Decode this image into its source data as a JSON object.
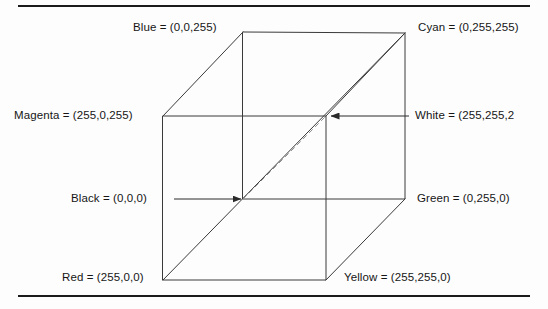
{
  "figure": {
    "rules": {
      "top": "horizontal-rule",
      "bottom": "horizontal-rule"
    }
  },
  "colors": {
    "line": "#3a3a3a",
    "line_dark": "#1b1b1b",
    "dashed": "#8c8c8c",
    "text": "#161616",
    "background": "#fdfdfd"
  },
  "vertices": [
    {
      "id": "blue",
      "label": "Blue = (0,0,255)",
      "rgb": "(0,0,255)",
      "position": "back-top-left"
    },
    {
      "id": "cyan",
      "label": "Cyan = (0,255,255)",
      "rgb": "(0,255,255)",
      "position": "back-top-right"
    },
    {
      "id": "magenta",
      "label": "Magenta = (255,0,255)",
      "rgb": "(255,0,255)",
      "position": "front-top-left"
    },
    {
      "id": "white",
      "label": "White = (255,255,2",
      "rgb": "(255,255,255)",
      "position": "front-top-right"
    },
    {
      "id": "black",
      "label": "Black = (0,0,0)",
      "rgb": "(0,0,0)",
      "position": "back-bottom-left"
    },
    {
      "id": "green",
      "label": "Green = (0,255,0)",
      "rgb": "(0,255,0)",
      "position": "back-bottom-right"
    },
    {
      "id": "red",
      "label": "Red = (255,0,0)",
      "rgb": "(255,0,0)",
      "position": "front-bottom-left"
    },
    {
      "id": "yellow",
      "label": "Yellow = (255,255,0)",
      "rgb": "(255,255,0)",
      "position": "front-bottom-right"
    }
  ],
  "annotations": {
    "black_arrow": "arrow-pointing-right-to-black-vertex",
    "white_arrow": "arrow-pointing-left-to-white-vertex",
    "gray_axis": "dashed-line-black-to-white",
    "diagonal": "solid-line-red-to-cyan"
  }
}
